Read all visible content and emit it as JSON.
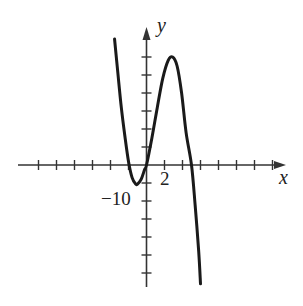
{
  "chart_data": {
    "type": "line",
    "title": "",
    "xlabel": "x",
    "ylabel": "y",
    "x_tick_label": "2",
    "y_tick_label": "−10",
    "x_tick_step": 2,
    "y_tick_step": 5,
    "xlim": [
      -14,
      16
    ],
    "ylim": [
      -34,
      38
    ],
    "grid": false,
    "legend": null,
    "series": [
      {
        "name": "f(x)",
        "x": [
          -3.55,
          -3.2,
          -2.8,
          -2.4,
          -2.0,
          -1.6,
          -1.2,
          -1.0,
          -0.6,
          -0.2,
          0,
          0.6,
          1.2,
          1.8,
          2.4,
          2.9,
          3.4,
          3.9,
          4.4,
          5.0,
          5.4,
          5.8,
          6.0
        ],
        "y": [
          35,
          26,
          16,
          8,
          1,
          -3.5,
          -5.3,
          -5.3,
          -4.0,
          -1.2,
          0,
          7.5,
          16,
          24,
          29,
          30,
          27.5,
          20,
          9,
          0,
          -11,
          -24,
          -33
        ]
      }
    ],
    "annotations": [
      {
        "text": "2",
        "x": 2,
        "y": 0
      },
      {
        "text": "−10",
        "x": 0,
        "y": -10
      }
    ]
  },
  "colors": {
    "curve": "#1a1a1a",
    "axis": "#333333"
  }
}
